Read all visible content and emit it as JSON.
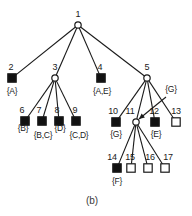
{
  "figure": {
    "caption": "(b)",
    "caption_pos": {
      "x": 92,
      "y": 200
    },
    "width": 192,
    "height": 216,
    "background": "#ffffff",
    "stroke_color": "#1a1a1a",
    "fill_solid": "#111111",
    "fill_open": "#ffffff"
  },
  "nodes": [
    {
      "id": "1",
      "shape": "circle",
      "x": 78,
      "y": 25,
      "label_x": 78,
      "label_y": 14,
      "set": null,
      "set_x": null,
      "set_y": null
    },
    {
      "id": "2",
      "shape": "filled-square",
      "x": 12,
      "y": 78,
      "label_x": 11,
      "label_y": 67,
      "set": "{A}",
      "set_x": 12,
      "set_y": 91
    },
    {
      "id": "3",
      "shape": "circle",
      "x": 55,
      "y": 78,
      "label_x": 55,
      "label_y": 67,
      "set": null,
      "set_x": null,
      "set_y": null
    },
    {
      "id": "4",
      "shape": "filled-square",
      "x": 101,
      "y": 78,
      "label_x": 100,
      "label_y": 67,
      "set": "{A,E}",
      "set_x": 102,
      "set_y": 91
    },
    {
      "id": "5",
      "shape": "circle",
      "x": 147,
      "y": 78,
      "label_x": 147,
      "label_y": 67,
      "set": "{G}",
      "set_x": 171,
      "set_y": 89
    },
    {
      "id": "6",
      "shape": "filled-square",
      "x": 25,
      "y": 121,
      "label_x": 22,
      "label_y": 110,
      "set": "{B}",
      "set_x": 23,
      "set_y": 128
    },
    {
      "id": "7",
      "shape": "filled-square",
      "x": 42,
      "y": 121,
      "label_x": 39,
      "label_y": 110,
      "set": "{B,C}",
      "set_x": 43,
      "set_y": 135
    },
    {
      "id": "8",
      "shape": "filled-square",
      "x": 59,
      "y": 121,
      "label_x": 57,
      "label_y": 110,
      "set": "{D}",
      "set_x": 60,
      "set_y": 128
    },
    {
      "id": "9",
      "shape": "filled-square",
      "x": 76,
      "y": 121,
      "label_x": 75,
      "label_y": 110,
      "set": "{C,D}",
      "set_x": 79,
      "set_y": 135
    },
    {
      "id": "10",
      "shape": "filled-square",
      "x": 116,
      "y": 122,
      "label_x": 113,
      "label_y": 111,
      "set": "{G}",
      "set_x": 116,
      "set_y": 134
    },
    {
      "id": "11",
      "shape": "circle",
      "x": 136,
      "y": 122,
      "label_x": 130,
      "label_y": 111,
      "set": null,
      "set_x": null,
      "set_y": null
    },
    {
      "id": "12",
      "shape": "filled-square",
      "x": 155,
      "y": 122,
      "label_x": 154,
      "label_y": 111,
      "set": "{E}",
      "set_x": 156,
      "set_y": 134
    },
    {
      "id": "13",
      "shape": "open-square",
      "x": 176,
      "y": 122,
      "label_x": 176,
      "label_y": 111,
      "set": null,
      "set_x": null,
      "set_y": null
    },
    {
      "id": "14",
      "shape": "filled-square",
      "x": 117,
      "y": 168,
      "label_x": 112,
      "label_y": 157,
      "set": "{F}",
      "set_x": 117,
      "set_y": 181
    },
    {
      "id": "15",
      "shape": "open-square",
      "x": 131,
      "y": 168,
      "label_x": 130,
      "label_y": 157,
      "set": null,
      "set_x": null,
      "set_y": null
    },
    {
      "id": "16",
      "shape": "open-square",
      "x": 148,
      "y": 168,
      "label_x": 150,
      "label_y": 157,
      "set": null,
      "set_x": null,
      "set_y": null
    },
    {
      "id": "17",
      "shape": "open-square",
      "x": 165,
      "y": 168,
      "label_x": 168,
      "label_y": 157,
      "set": null,
      "set_x": null,
      "set_y": null
    }
  ],
  "edges": [
    {
      "from": "1",
      "to": "2"
    },
    {
      "from": "1",
      "to": "3"
    },
    {
      "from": "1",
      "to": "4"
    },
    {
      "from": "1",
      "to": "5"
    },
    {
      "from": "3",
      "to": "6"
    },
    {
      "from": "3",
      "to": "7"
    },
    {
      "from": "3",
      "to": "8"
    },
    {
      "from": "3",
      "to": "9"
    },
    {
      "from": "5",
      "to": "10"
    },
    {
      "from": "5",
      "to": "11"
    },
    {
      "from": "5",
      "to": "12"
    },
    {
      "from": "5",
      "to": "13"
    },
    {
      "from": "11",
      "to": "14"
    },
    {
      "from": "11",
      "to": "15"
    },
    {
      "from": "11",
      "to": "16"
    },
    {
      "from": "11",
      "to": "17"
    }
  ],
  "annotation_arrow": {
    "name": "g-label-pointer",
    "from_x": 166,
    "from_y": 97,
    "to_x": 139,
    "to_y": 119
  }
}
